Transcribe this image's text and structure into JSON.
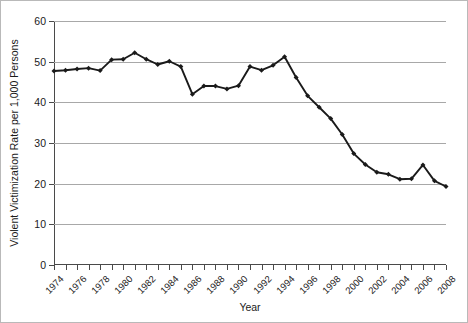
{
  "chart_data": {
    "type": "line",
    "title": "",
    "xlabel": "Year",
    "ylabel": "Violent Victimization Rate per 1,000 Persons",
    "xlim": [
      1974,
      2008
    ],
    "ylim": [
      0,
      60
    ],
    "y_ticks": [
      0,
      10,
      20,
      30,
      40,
      50,
      60
    ],
    "y_tick_labels": [
      "0",
      "10",
      "20",
      "30",
      "40",
      "50",
      "60"
    ],
    "x_tick_labels": [
      "1974",
      "1976",
      "1978",
      "1980",
      "1982",
      "1984",
      "1986",
      "1988",
      "1990",
      "1992",
      "1994",
      "1996",
      "1998",
      "2000",
      "2002",
      "2004",
      "2006",
      "2008"
    ],
    "x_tick_interval": 2,
    "x_minor_tick_interval": 1,
    "grid": "horizontal",
    "legend": "none",
    "marker": "filled-diamond",
    "line_color": "#1a1a1a",
    "grid_color": "#a8a8a8",
    "x": [
      1974,
      1975,
      1976,
      1977,
      1978,
      1979,
      1980,
      1981,
      1982,
      1983,
      1984,
      1985,
      1986,
      1987,
      1988,
      1989,
      1990,
      1991,
      1992,
      1993,
      1994,
      1995,
      1996,
      1997,
      1998,
      1999,
      2000,
      2001,
      2002,
      2003,
      2004,
      2005,
      2006,
      2007,
      2008
    ],
    "values": [
      47.7,
      47.9,
      48.2,
      48.4,
      47.8,
      50.5,
      50.6,
      52.2,
      50.6,
      49.3,
      50.1,
      48.8,
      42.0,
      44.0,
      44.0,
      43.3,
      44.1,
      48.8,
      47.9,
      49.1,
      51.2,
      46.1,
      41.6,
      38.8,
      36.0,
      32.1,
      27.4,
      24.7,
      22.8,
      22.3,
      21.1,
      21.2,
      24.6,
      20.7,
      19.3
    ]
  }
}
